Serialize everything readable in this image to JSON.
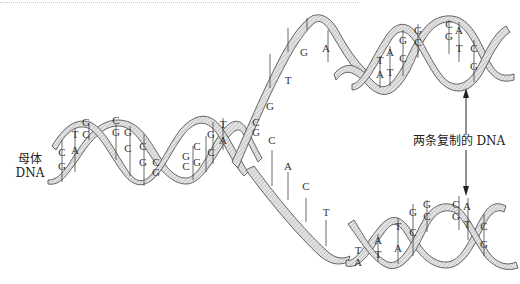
{
  "figure": {
    "parent_label_line1": "母体",
    "parent_label_line2": "DNA",
    "daughter_label": "两条复制的 DNA",
    "strand_fill_color": "#d9d9d9",
    "strand_outline_color": "#555555"
  },
  "parent_helix": {
    "base_pairs": [
      {
        "top": "C",
        "bottom": "G"
      },
      {
        "top": "T",
        "bottom": "A"
      },
      {
        "top": "G",
        "bottom": "C"
      },
      {
        "top": "C",
        "bottom": "G"
      },
      {
        "top": "G",
        "bottom": "C"
      },
      {
        "top": "C",
        "bottom": "G"
      },
      {
        "top": "C",
        "bottom": "G"
      },
      {
        "top": "G",
        "bottom": "C"
      },
      {
        "top": "C",
        "bottom": "G"
      },
      {
        "top": "G",
        "bottom": "C"
      },
      {
        "top": "T",
        "bottom": "A"
      },
      {
        "top": "C",
        "bottom": "G"
      }
    ]
  },
  "fork": {
    "upper_unpaired_bases": [
      "G",
      "T",
      "G",
      "A"
    ],
    "lower_unpaired_bases": [
      "C",
      "A",
      "C",
      "T"
    ]
  },
  "daughter_top": {
    "base_pairs": [
      {
        "top": "T",
        "bottom": "A"
      },
      {
        "top": "A",
        "bottom": "T"
      },
      {
        "top": "G",
        "bottom": "C"
      },
      {
        "top": "G",
        "bottom": "C"
      },
      {
        "top": "C",
        "bottom": "G"
      },
      {
        "top": "A",
        "bottom": "T"
      },
      {
        "top": "C",
        "bottom": "G"
      }
    ]
  },
  "daughter_bottom": {
    "base_pairs": [
      {
        "top": "T",
        "bottom": "A"
      },
      {
        "top": "A",
        "bottom": "T"
      },
      {
        "top": "T",
        "bottom": "A"
      },
      {
        "top": "G",
        "bottom": "C"
      },
      {
        "top": "G",
        "bottom": "C"
      },
      {
        "top": "C",
        "bottom": "G"
      },
      {
        "top": "A",
        "bottom": "T"
      },
      {
        "top": "C",
        "bottom": "G"
      }
    ]
  }
}
